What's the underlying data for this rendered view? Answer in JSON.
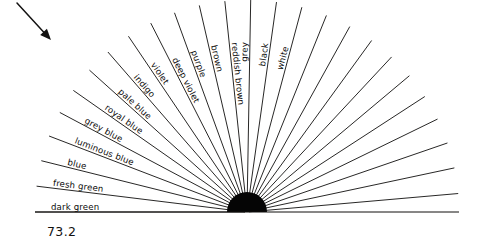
{
  "figure": {
    "caption": "73.2",
    "ink_color": "#100f0d",
    "background_color": "#ffffff",
    "hub_color": "#050505"
  },
  "fan": {
    "center_x": 247,
    "center_y": 212,
    "hub_radius": 20,
    "ray_length": 212,
    "total_rays": 30,
    "labeled_rays": 16,
    "unlabeled_rays": 14,
    "start_angle_deg": 180,
    "end_angle_deg": 0,
    "labels": [
      {
        "text": "dark green",
        "angle_deg": 180.0
      },
      {
        "text": "fresh green",
        "angle_deg": 173.0
      },
      {
        "text": "blue",
        "angle_deg": 166.0
      },
      {
        "text": "luminous blue",
        "angle_deg": 159.0
      },
      {
        "text": "grey blue",
        "angle_deg": 152.0
      },
      {
        "text": "royal blue",
        "angle_deg": 145.0
      },
      {
        "text": "pale blue",
        "angle_deg": 138.0
      },
      {
        "text": "indigo",
        "angle_deg": 131.0
      },
      {
        "text": "violet",
        "angle_deg": 124.0
      },
      {
        "text": "deep violet",
        "angle_deg": 117.0
      },
      {
        "text": "purple",
        "angle_deg": 110.0
      },
      {
        "text": "brown",
        "angle_deg": 103.0
      },
      {
        "text": "reddish brown",
        "angle_deg": 96.0
      },
      {
        "text": "grey",
        "angle_deg": 89.0
      },
      {
        "text": "black",
        "angle_deg": 82.0
      },
      {
        "text": "white",
        "angle_deg": 75.0
      }
    ],
    "unlabeled_angles_deg": [
      68,
      61,
      54,
      47,
      40,
      33,
      26,
      19,
      12,
      5
    ]
  },
  "arrow": {
    "name": "pointer-arrow",
    "x1": 17,
    "y1": 3,
    "x2": 51,
    "y2": 40,
    "direction": "down-right"
  }
}
